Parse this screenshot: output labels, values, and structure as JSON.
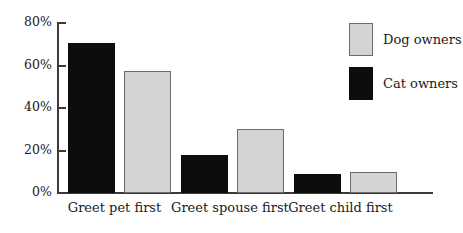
{
  "chart_data": {
    "type": "bar",
    "title": "",
    "subtitle": "",
    "xlabel": "",
    "ylabel": "",
    "categories": [
      "Greet pet first",
      "Greet spouse first",
      "Greet child first"
    ],
    "series": [
      {
        "name": "Cat owners",
        "color": "#0d0d0d",
        "values": [
          70,
          18,
          9
        ]
      },
      {
        "name": "Dog owners",
        "color": "#d4d4d4",
        "values": [
          57,
          30,
          10
        ]
      }
    ],
    "ylim": [
      0,
      80
    ],
    "ytick_values": [
      0,
      20,
      40,
      60,
      80
    ],
    "ytick_labels": [
      "0%",
      "20%",
      "40%",
      "60%",
      "80%"
    ],
    "grid": false,
    "legend_position": "top-right",
    "legend_order": [
      "Dog owners",
      "Cat owners"
    ],
    "value_suffix": "%"
  },
  "axis": {
    "y_labels": [
      "80%",
      "60%",
      "40%",
      "20%",
      "0%"
    ]
  },
  "legend": {
    "items": [
      {
        "label": "Dog owners",
        "swatch": "dog-swatch"
      },
      {
        "label": "Cat owners",
        "swatch": "cat-swatch"
      }
    ]
  }
}
